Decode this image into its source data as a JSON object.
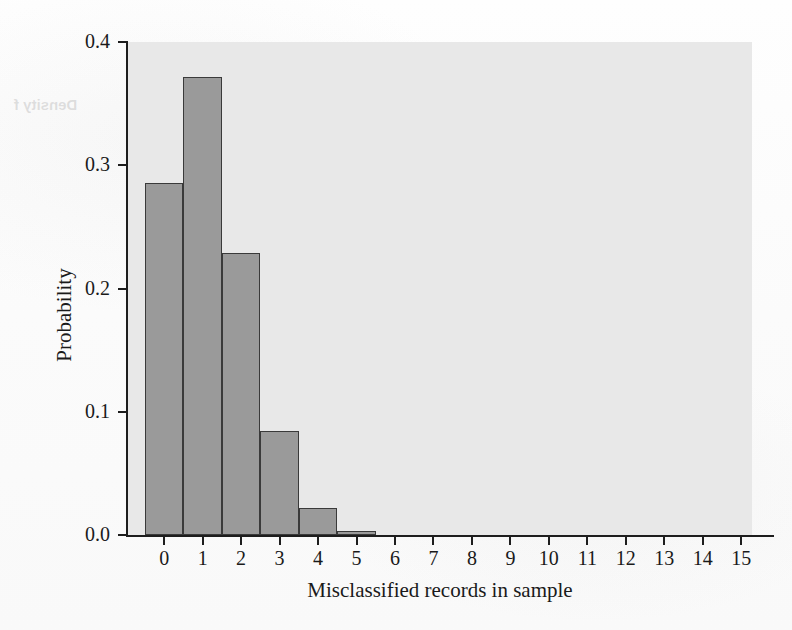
{
  "chart_data": {
    "type": "bar",
    "title": "",
    "xlabel": "Misclassified records in sample",
    "ylabel": "Probability",
    "categories": [
      "0",
      "1",
      "2",
      "3",
      "4",
      "5",
      "6",
      "7",
      "8",
      "9",
      "10",
      "11",
      "12",
      "13",
      "14",
      "15"
    ],
    "values": [
      0.286,
      0.372,
      0.229,
      0.084,
      0.022,
      0.003,
      0.0,
      0.0,
      0.0,
      0.0,
      0.0,
      0.0,
      0.0,
      0.0,
      0.0,
      0.0
    ],
    "ylim": [
      0.0,
      0.4
    ],
    "xlim": [
      -0.5,
      15.5
    ],
    "y_ticks": [
      "0.0",
      "0.1",
      "0.2",
      "0.3",
      "0.4"
    ],
    "y_tick_values": [
      0.0,
      0.1,
      0.2,
      0.3,
      0.4
    ],
    "grid": false,
    "legend": false,
    "legend_position": "none",
    "bar_fill_color": "#9a9a9a",
    "bar_edge_color": "#3a3a3a",
    "plot_background_color": "#e8e8e8",
    "page_background_color": "#fdfdfd",
    "axis_color": "#1d1d1d"
  },
  "ghost_text": {
    "top": "Density f",
    "mid": "ulation",
    "low": "sample"
  }
}
